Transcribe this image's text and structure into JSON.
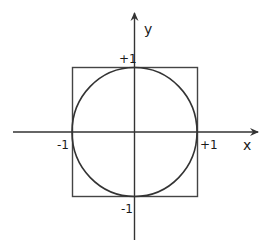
{
  "figure": {
    "axes": {
      "x_label": "x",
      "y_label": "y"
    },
    "tick_labels": {
      "x_neg": "-1",
      "x_pos": "+1",
      "y_pos": "+1",
      "y_neg": "-1"
    },
    "shapes": {
      "circle": {
        "center": [
          0,
          0
        ],
        "radius": 1
      },
      "square": {
        "xmin": -1,
        "xmax": 1,
        "ymin": -1,
        "ymax": 1
      }
    },
    "colors": {
      "stroke": "#333333",
      "background": "#ffffff"
    }
  }
}
